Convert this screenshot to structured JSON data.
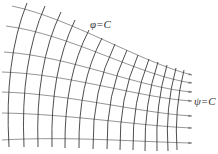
{
  "diagram": {
    "labels": {
      "equipotential": "φ=C",
      "streamline": "ψ=C"
    },
    "colors": {
      "streamline": "#7a7a7a",
      "equipotential": "#3a3a3a",
      "label": "#333333",
      "background": "#ffffff"
    },
    "streamlines": [
      {
        "start": [
          12,
          6
        ],
        "c1": [
          70,
          18
        ],
        "c2": [
          140,
          62
        ],
        "end": [
          192,
          75
        ]
      },
      {
        "start": [
          6,
          26
        ],
        "c1": [
          70,
          34
        ],
        "c2": [
          140,
          76
        ],
        "end": [
          192,
          83
        ]
      },
      {
        "start": [
          4,
          52
        ],
        "c1": [
          70,
          56
        ],
        "c2": [
          140,
          88
        ],
        "end": [
          192,
          92
        ]
      },
      {
        "start": [
          2,
          72
        ],
        "c1": [
          70,
          74
        ],
        "c2": [
          140,
          98
        ],
        "end": [
          192,
          101
        ]
      },
      {
        "start": [
          2,
          92
        ],
        "c1": [
          70,
          94
        ],
        "c2": [
          140,
          113
        ],
        "end": [
          192,
          116
        ]
      },
      {
        "start": [
          2,
          113
        ],
        "c1": [
          70,
          114
        ],
        "c2": [
          140,
          126
        ],
        "end": [
          192,
          128
        ]
      },
      {
        "start": [
          2,
          140
        ],
        "c1": [
          70,
          136
        ],
        "c2": [
          140,
          142
        ],
        "end": [
          192,
          143
        ]
      }
    ],
    "equipotentials": [
      {
        "top": [
          27,
          3
        ],
        "ctrl": [
          4,
          60
        ],
        "bottom": [
          9,
          147
        ]
      },
      {
        "top": [
          45,
          6
        ],
        "ctrl": [
          20,
          62
        ],
        "bottom": [
          24,
          147
        ]
      },
      {
        "top": [
          61,
          12
        ],
        "ctrl": [
          35,
          66
        ],
        "bottom": [
          38,
          147
        ]
      },
      {
        "top": [
          75,
          20
        ],
        "ctrl": [
          50,
          72
        ],
        "bottom": [
          52,
          147
        ]
      },
      {
        "top": [
          89,
          30
        ],
        "ctrl": [
          64,
          78
        ],
        "bottom": [
          65,
          148
        ]
      },
      {
        "top": [
          102,
          38
        ],
        "ctrl": [
          78,
          84
        ],
        "bottom": [
          79,
          148
        ]
      },
      {
        "top": [
          115,
          44
        ],
        "ctrl": [
          92,
          90
        ],
        "bottom": [
          93,
          149
        ]
      },
      {
        "top": [
          127,
          50
        ],
        "ctrl": [
          106,
          94
        ],
        "bottom": [
          107,
          149
        ]
      },
      {
        "top": [
          138,
          55
        ],
        "ctrl": [
          119,
          98
        ],
        "bottom": [
          120,
          150
        ]
      },
      {
        "top": [
          149,
          59
        ],
        "ctrl": [
          132,
          102
        ],
        "bottom": [
          133,
          150
        ]
      },
      {
        "top": [
          158,
          62
        ],
        "ctrl": [
          144,
          104
        ],
        "bottom": [
          145,
          151
        ]
      },
      {
        "top": [
          167,
          65
        ],
        "ctrl": [
          155,
          106
        ],
        "bottom": [
          157,
          151
        ]
      },
      {
        "top": [
          176,
          68
        ],
        "ctrl": [
          165,
          108
        ],
        "bottom": [
          168,
          151
        ]
      },
      {
        "top": [
          184,
          70
        ],
        "ctrl": [
          174,
          110
        ],
        "bottom": [
          177,
          150
        ]
      }
    ]
  }
}
